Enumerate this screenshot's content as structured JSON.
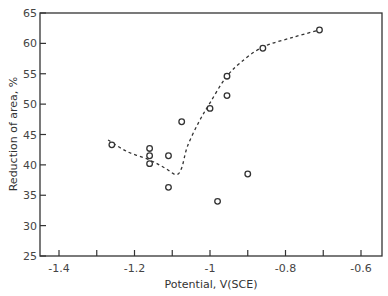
{
  "chart_data": {
    "type": "scatter",
    "title": "",
    "xlabel": "Potential, V(SCE)",
    "ylabel": "Reduction of area, %",
    "xlim": [
      -1.45,
      -0.55
    ],
    "ylim": [
      25,
      65
    ],
    "x_ticks": [
      -1.4,
      -1.3,
      -1.2,
      -1.1,
      -1.0,
      -0.9,
      -0.8,
      -0.7,
      -0.6
    ],
    "x_tick_labels": [
      "-1.4",
      "",
      "-1.2",
      "",
      "-1",
      "",
      "-0.8",
      "",
      "-0.6"
    ],
    "y_ticks": [
      25,
      30,
      35,
      40,
      45,
      50,
      55,
      60,
      65
    ],
    "y_tick_labels": [
      "25",
      "30",
      "35",
      "40",
      "45",
      "50",
      "55",
      "60",
      "65"
    ],
    "grid": false,
    "legend": null,
    "series": [
      {
        "name": "measured",
        "marker": "open-circle",
        "points": [
          {
            "x": -1.26,
            "y": 43.3
          },
          {
            "x": -1.16,
            "y": 42.7
          },
          {
            "x": -1.16,
            "y": 41.5
          },
          {
            "x": -1.16,
            "y": 40.2
          },
          {
            "x": -1.11,
            "y": 41.5
          },
          {
            "x": -1.11,
            "y": 36.3
          },
          {
            "x": -1.075,
            "y": 47.1
          },
          {
            "x": -1.0,
            "y": 49.3
          },
          {
            "x": -0.98,
            "y": 34.0
          },
          {
            "x": -0.955,
            "y": 54.6
          },
          {
            "x": -0.955,
            "y": 51.4
          },
          {
            "x": -0.9,
            "y": 38.5
          },
          {
            "x": -0.86,
            "y": 59.2
          },
          {
            "x": -0.71,
            "y": 62.2
          }
        ]
      },
      {
        "name": "trend",
        "style": "dashed-line",
        "points": [
          {
            "x": -1.27,
            "y": 44.1
          },
          {
            "x": -1.22,
            "y": 42.2
          },
          {
            "x": -1.16,
            "y": 40.8
          },
          {
            "x": -1.12,
            "y": 39.5
          },
          {
            "x": -1.09,
            "y": 38.4
          },
          {
            "x": -1.075,
            "y": 39.5
          },
          {
            "x": -1.06,
            "y": 43.0
          },
          {
            "x": -1.03,
            "y": 47.0
          },
          {
            "x": -1.0,
            "y": 50.2
          },
          {
            "x": -0.96,
            "y": 54.2
          },
          {
            "x": -0.92,
            "y": 56.8
          },
          {
            "x": -0.86,
            "y": 59.4
          },
          {
            "x": -0.78,
            "y": 61.0
          },
          {
            "x": -0.71,
            "y": 62.2
          }
        ]
      }
    ]
  }
}
